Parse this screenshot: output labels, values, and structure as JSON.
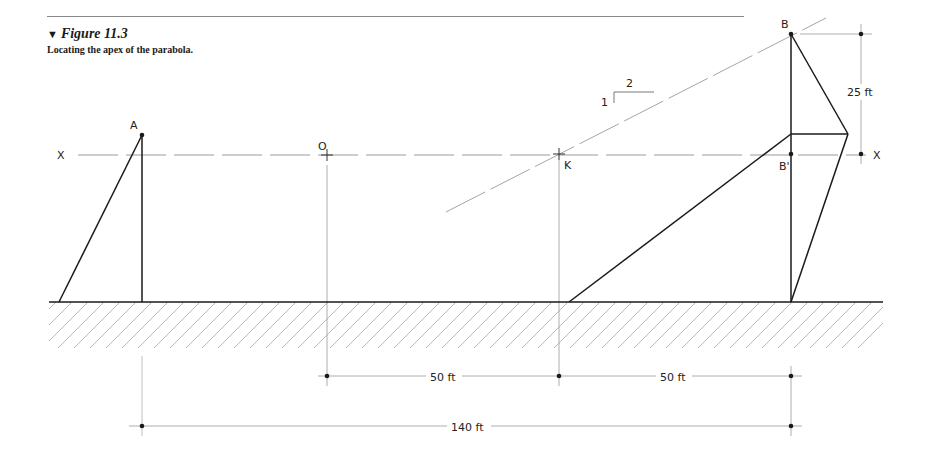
{
  "figure": {
    "marker": "▼",
    "number": "Figure 11.3",
    "caption": "Locating the apex of the parabola."
  },
  "points": {
    "A": "A",
    "O": "O",
    "K": "K",
    "B": "B",
    "B_prime": "B'",
    "axis_left": "X",
    "axis_right": "X"
  },
  "slope": {
    "rise": "1",
    "run": "2"
  },
  "dimensions": {
    "vertical_rise": "25 ft",
    "O_to_K": "50 ft",
    "K_to_B": "50 ft",
    "A_to_B": "140 ft"
  },
  "colors": {
    "ink": "#1a1a1a",
    "construction": "#9a9a9a",
    "hatch": "#a8a8a8"
  }
}
